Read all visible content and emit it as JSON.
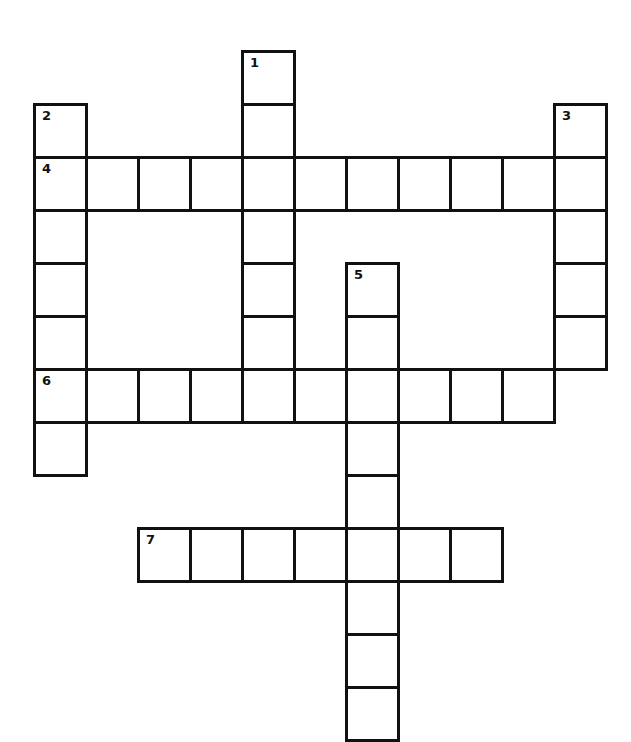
{
  "puzzle": {
    "type": "crossword",
    "cell_size": 52,
    "origin": {
      "x": 33,
      "y": 50
    },
    "line_color": "#111111",
    "background": "#ffffff",
    "words": [
      {
        "number": "1",
        "direction": "down",
        "row": 0,
        "col": 4,
        "length": 7
      },
      {
        "number": "2",
        "direction": "down",
        "row": 1,
        "col": 0,
        "length": 7
      },
      {
        "number": "3",
        "direction": "down",
        "row": 1,
        "col": 10,
        "length": 5
      },
      {
        "number": "4",
        "direction": "across",
        "row": 2,
        "col": 0,
        "length": 11
      },
      {
        "number": "5",
        "direction": "down",
        "row": 4,
        "col": 6,
        "length": 9
      },
      {
        "number": "6",
        "direction": "across",
        "row": 6,
        "col": 0,
        "length": 10
      },
      {
        "number": "7",
        "direction": "across",
        "row": 9,
        "col": 2,
        "length": 7
      }
    ]
  }
}
